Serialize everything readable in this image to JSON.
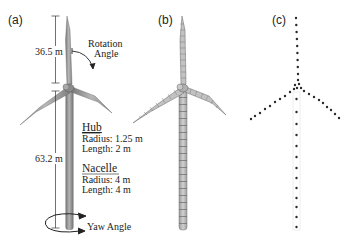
{
  "figure": {
    "panels": [
      {
        "label": "(a)",
        "description": "Wind turbine geometry with dimensions",
        "annotations": {
          "blade_length": "36.5 m",
          "tower_height": "63.2 m",
          "rotation_label_line1": "Rotation",
          "rotation_label_line2": "Angle",
          "yaw_label": "Yaw Angle"
        },
        "hub": {
          "title": "Hub",
          "radius": "Radius: 1.25 m",
          "length": "Length: 2 m"
        },
        "nacelle": {
          "title": "Nacelle",
          "radius": "Radius: 4 m",
          "length": "Length: 4 m"
        }
      },
      {
        "label": "(b)",
        "description": "Meshed surface model of the wind turbine"
      },
      {
        "label": "(c)",
        "description": "Point (node) representation of the wind turbine"
      }
    ],
    "colors": {
      "turbine_fill": "#9a9a9a",
      "turbine_dark": "#6e6e6e",
      "mesh_fill": "#b8b8b8",
      "dot": "#2a2a2a",
      "text": "#222222"
    }
  }
}
